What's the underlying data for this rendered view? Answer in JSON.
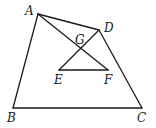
{
  "diagram": {
    "type": "geometry",
    "points": {
      "A": {
        "x": 38,
        "y": 14
      },
      "B": {
        "x": 13,
        "y": 108
      },
      "C": {
        "x": 142,
        "y": 108
      },
      "D": {
        "x": 99,
        "y": 30
      },
      "E": {
        "x": 59,
        "y": 70
      },
      "F": {
        "x": 108,
        "y": 70
      },
      "G": {
        "x": 81,
        "y": 49
      }
    },
    "segments": [
      {
        "from": "A",
        "to": "B"
      },
      {
        "from": "B",
        "to": "C"
      },
      {
        "from": "C",
        "to": "D"
      },
      {
        "from": "D",
        "to": "A"
      },
      {
        "from": "A",
        "to": "F"
      },
      {
        "from": "D",
        "to": "E"
      },
      {
        "from": "E",
        "to": "F"
      }
    ],
    "labels": {
      "A": "A",
      "B": "B",
      "C": "C",
      "D": "D",
      "E": "E",
      "F": "F",
      "G": "G"
    },
    "stroke_color": "#1a1a1a",
    "background": "#ffffff"
  }
}
